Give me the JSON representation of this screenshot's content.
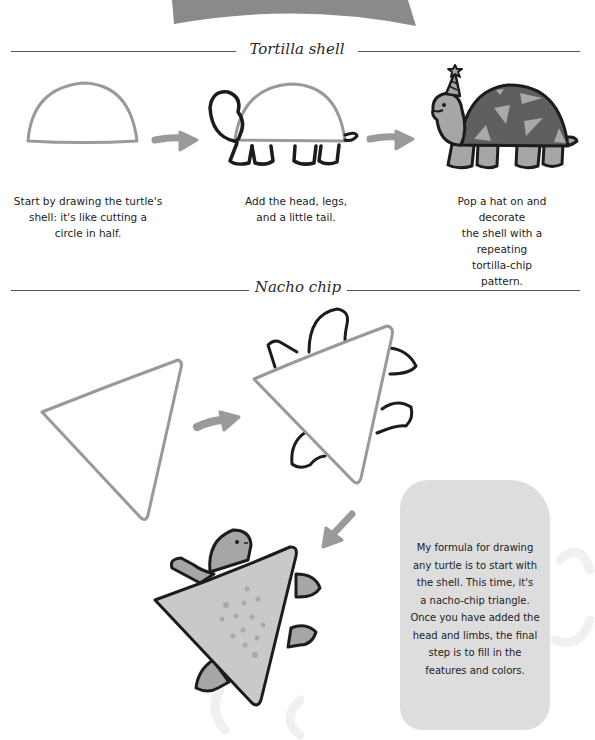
{
  "sections": [
    {
      "title": "Tortilla shell",
      "steps": [
        {
          "id": "shell-outline",
          "caption": "Start by drawing the turtle's\nshell: it's like cutting a\ncircle in half."
        },
        {
          "id": "head-legs-tail",
          "caption": "Add the head, legs,\nand a little tail."
        },
        {
          "id": "hat-pattern",
          "caption": "Pop a hat on and decorate\nthe shell with a repeating\ntortilla-chip pattern."
        }
      ]
    },
    {
      "title": "Nacho chip",
      "steps": [
        {
          "id": "triangle-outline"
        },
        {
          "id": "triangle-limbs"
        },
        {
          "id": "triangle-colored"
        }
      ],
      "note": "My formula for drawing\nany turtle is to start with\nthe shell. This time, it's\na nacho-chip triangle.\nOnce you have added the\nhead and limbs, the final\nstep is to fill in the\nfeatures and colors."
    }
  ],
  "colors": {
    "banner": "#8a8a8a",
    "outline_light": "#999999",
    "outline_dark": "#1c1c1c",
    "arrow": "#9a9a9a",
    "shell_fill": "#5f5f5f",
    "body_fill": "#a6a6a6",
    "chip_light": "#c9c9c9",
    "note_bg": "#dddddd"
  }
}
